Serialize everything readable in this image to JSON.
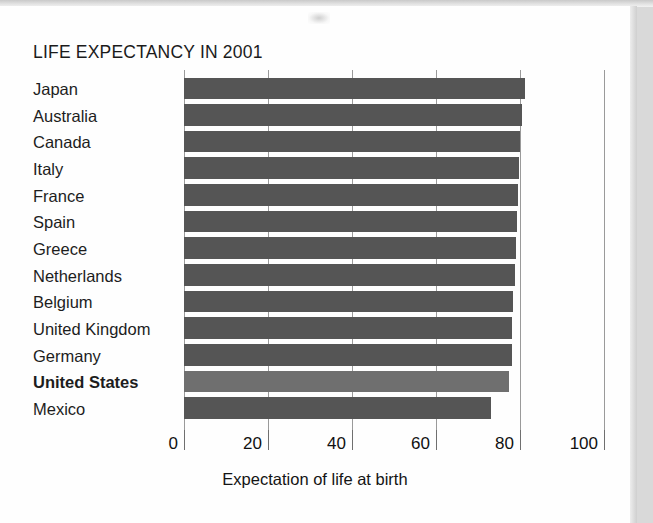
{
  "chart_data": {
    "type": "bar",
    "orientation": "horizontal",
    "title": "LIFE EXPECTANCY IN 2001",
    "xlabel": "Expectation of life at birth",
    "ylabel": "",
    "xlim": [
      0,
      100
    ],
    "xticks": [
      0,
      20,
      40,
      60,
      80,
      100
    ],
    "xtick_labels": [
      "0",
      "20",
      "40",
      "60",
      "80",
      "100"
    ],
    "grid": true,
    "legend": null,
    "categories": [
      "Japan",
      "Australia",
      "Canada",
      "Italy",
      "France",
      "Spain",
      "Greece",
      "Netherlands",
      "Belgium",
      "United Kingdom",
      "Germany",
      "United States",
      "Mexico"
    ],
    "values": [
      81.3,
      80.4,
      80.0,
      79.8,
      79.5,
      79.3,
      79.0,
      78.7,
      78.4,
      78.2,
      78.1,
      77.4,
      73.0
    ],
    "bars": [
      {
        "label": "Japan",
        "value": 81.3,
        "emphasis": false
      },
      {
        "label": "Australia",
        "value": 80.4,
        "emphasis": false
      },
      {
        "label": "Canada",
        "value": 80.0,
        "emphasis": false
      },
      {
        "label": "Italy",
        "value": 79.8,
        "emphasis": false
      },
      {
        "label": "France",
        "value": 79.5,
        "emphasis": false
      },
      {
        "label": "Spain",
        "value": 79.3,
        "emphasis": false
      },
      {
        "label": "Greece",
        "value": 79.0,
        "emphasis": false
      },
      {
        "label": "Netherlands",
        "value": 78.7,
        "emphasis": false
      },
      {
        "label": "Belgium",
        "value": 78.4,
        "emphasis": false
      },
      {
        "label": "United Kingdom",
        "value": 78.2,
        "emphasis": false
      },
      {
        "label": "Germany",
        "value": 78.1,
        "emphasis": false
      },
      {
        "label": "United States",
        "value": 77.4,
        "emphasis": true
      },
      {
        "label": "Mexico",
        "value": 73.0,
        "emphasis": false
      }
    ],
    "colors": {
      "bar": "#555555",
      "bar_highlight": "#6f6f6f",
      "gridline": "#9a9a9a",
      "text": "#1b1b1b",
      "panel_background": "#fefefe"
    }
  }
}
